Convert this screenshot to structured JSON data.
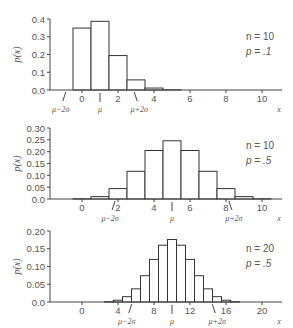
{
  "chart_data": [
    {
      "type": "bar",
      "title": "",
      "xlabel": "x",
      "ylabel": "p(x)",
      "params": {
        "n_label": "n = 10",
        "p_label": "p = .1"
      },
      "x": [
        0,
        1,
        2,
        3,
        4,
        5,
        6,
        7,
        8,
        9,
        10
      ],
      "values": [
        0.349,
        0.387,
        0.194,
        0.057,
        0.011,
        0.001,
        0.0,
        0.0,
        0.0,
        0.0,
        0.0
      ],
      "ylim": [
        0,
        0.4
      ],
      "yticks": [
        "0.0",
        "0.1",
        "0.2",
        "0.3",
        "0.4"
      ],
      "ytick_values": [
        0,
        0.1,
        0.2,
        0.3,
        0.4
      ],
      "xticks": [
        "0",
        "2",
        "4",
        "6",
        "8",
        "10"
      ],
      "xtick_values": [
        0,
        2,
        4,
        6,
        8,
        10
      ],
      "xlim": [
        -1.5,
        11
      ],
      "bar_width_units": 1,
      "annotations": {
        "mu": 1.0,
        "mu_minus_2sigma": -0.9,
        "mu_plus_2sigma": 2.9,
        "mu_label": "μ",
        "minus_label": "μ−2σ",
        "plus_label": "μ+2σ"
      },
      "grid": false
    },
    {
      "type": "bar",
      "title": "",
      "xlabel": "x",
      "ylabel": "p(x)",
      "params": {
        "n_label": "n = 10",
        "p_label": "p = .5"
      },
      "x": [
        0,
        1,
        2,
        3,
        4,
        5,
        6,
        7,
        8,
        9,
        10
      ],
      "values": [
        0.001,
        0.01,
        0.044,
        0.117,
        0.205,
        0.246,
        0.205,
        0.117,
        0.044,
        0.01,
        0.001
      ],
      "ylim": [
        0,
        0.3
      ],
      "yticks": [
        "0.0",
        "0.05",
        "0.10",
        "0.15",
        "0.20",
        "0.25",
        "0.30"
      ],
      "ytick_values": [
        0,
        0.05,
        0.1,
        0.15,
        0.2,
        0.25,
        0.3
      ],
      "xticks": [
        "0",
        "2",
        "4",
        "6",
        "8",
        "10"
      ],
      "xtick_values": [
        0,
        2,
        4,
        6,
        8,
        10
      ],
      "xlim": [
        -1.5,
        11
      ],
      "bar_width_units": 1,
      "annotations": {
        "mu": 5.0,
        "mu_minus_2sigma": 1.84,
        "mu_plus_2sigma": 8.16,
        "mu_label": "μ",
        "minus_label": "μ−2σ",
        "plus_label": "μ+2σ"
      },
      "grid": false
    },
    {
      "type": "bar",
      "title": "",
      "xlabel": "x",
      "ylabel": "p(x)",
      "params": {
        "n_label": "n = 20",
        "p_label": "p = .5"
      },
      "x": [
        0,
        1,
        2,
        3,
        4,
        5,
        6,
        7,
        8,
        9,
        10,
        11,
        12,
        13,
        14,
        15,
        16,
        17,
        18,
        19,
        20
      ],
      "values": [
        0.0,
        0.0,
        0.0,
        0.001,
        0.005,
        0.015,
        0.037,
        0.074,
        0.12,
        0.16,
        0.176,
        0.16,
        0.12,
        0.074,
        0.037,
        0.015,
        0.005,
        0.001,
        0.0,
        0.0,
        0.0
      ],
      "ylim": [
        0,
        0.2
      ],
      "yticks": [
        "0.0",
        "0.05",
        "0.10",
        "0.15",
        "0.20"
      ],
      "ytick_values": [
        0,
        0.05,
        0.1,
        0.15,
        0.2
      ],
      "xticks": [
        "0",
        "4",
        "8",
        "12",
        "16",
        "20"
      ],
      "xtick_values": [
        0,
        4,
        8,
        12,
        16,
        20
      ],
      "xlim": [
        -3,
        22
      ],
      "bar_width_units": 1,
      "annotations": {
        "mu": 10.0,
        "mu_minus_2sigma": 5.53,
        "mu_plus_2sigma": 14.47,
        "mu_label": "μ",
        "minus_label": "μ−2σ",
        "plus_label": "μ+2σ"
      },
      "grid": false
    }
  ],
  "layout": [
    {
      "y_top": 19,
      "y_base": 90,
      "x0_px": 82,
      "unit_px": 18,
      "axis_left": 50,
      "axis_right": 282
    },
    {
      "y_top": 128,
      "y_base": 199,
      "x0_px": 82,
      "unit_px": 18,
      "axis_left": 50,
      "axis_right": 282
    },
    {
      "y_top": 231,
      "y_base": 302,
      "x0_px": 82,
      "unit_px": 9,
      "axis_left": 50,
      "axis_right": 282
    }
  ]
}
